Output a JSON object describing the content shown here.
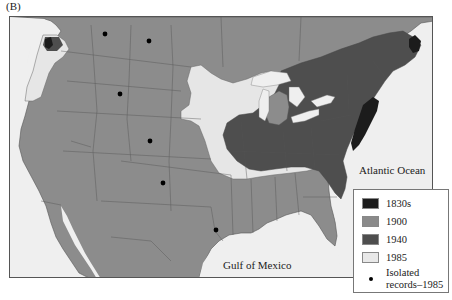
{
  "panel_label": "(B)",
  "map": {
    "ocean_labels": {
      "atlantic": "Atlantic Ocean",
      "gulf": "Gulf of Mexico"
    },
    "colors": {
      "background_sea": "#efefef",
      "land_1900": "#8c8c8c",
      "range_1830s": "#1c1c1c",
      "range_1940": "#4e4e4e",
      "range_1985": "#e6e6e6",
      "borders": "#555555",
      "isolated_dot": "#000000"
    },
    "isolated_record_dots": [
      {
        "x": 104,
        "y": 33
      },
      {
        "x": 148,
        "y": 40
      },
      {
        "x": 119,
        "y": 93
      },
      {
        "x": 149,
        "y": 140
      },
      {
        "x": 162,
        "y": 182
      },
      {
        "x": 215,
        "y": 229
      }
    ]
  },
  "legend": {
    "items": [
      {
        "label": "1830s",
        "color": "#1c1c1c"
      },
      {
        "label": "1900",
        "color": "#8a8a8a"
      },
      {
        "label": "1940",
        "color": "#4e4e4e"
      },
      {
        "label": "1985",
        "color": "#e8e8e8"
      }
    ],
    "isolated_label_line1": "Isolated",
    "isolated_label_line2": "records–1985"
  }
}
